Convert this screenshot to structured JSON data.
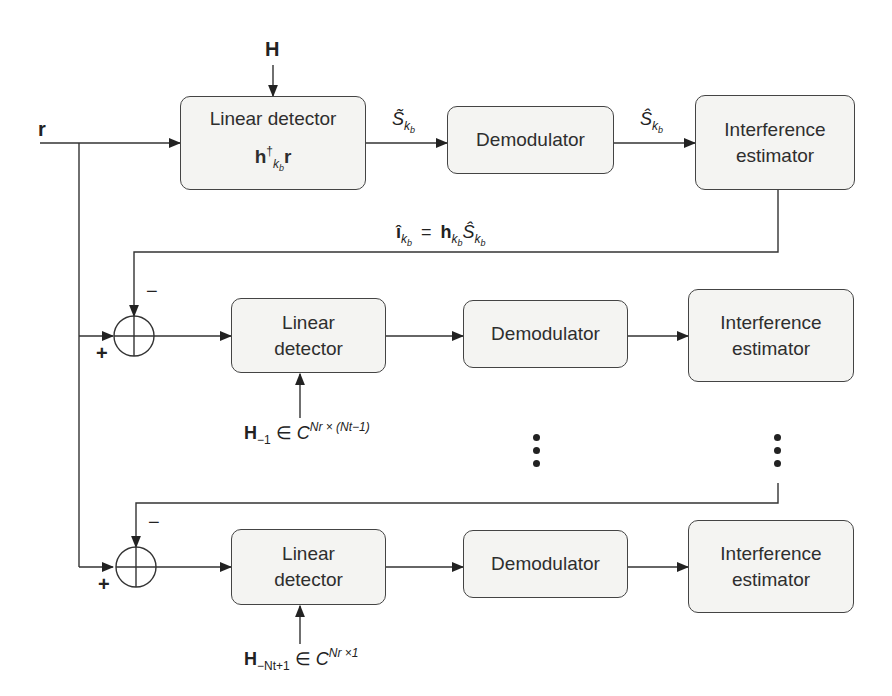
{
  "inputs": {
    "r": "r",
    "H": "H"
  },
  "row1": {
    "linear_detector": {
      "title": "Linear detector",
      "formula_main": "h",
      "formula_sup": "†",
      "formula_sub": "k",
      "formula_subsub": "b",
      "formula_tail": "r"
    },
    "edge1": {
      "symbol": "S̃",
      "sub": "k",
      "subsub": "b"
    },
    "demodulator": {
      "title": "Demodulator"
    },
    "edge2": {
      "symbol": "Ŝ",
      "sub": "k",
      "subsub": "b"
    },
    "interference_estimator": {
      "line1": "Interference",
      "line2": "estimator"
    },
    "feedback": {
      "lhs": "î",
      "lhs_sub": "k",
      "lhs_subsub": "b",
      "eq": "=",
      "rhs_h": "h",
      "rhs_h_sub": "k",
      "rhs_h_subsub": "b",
      "rhs_s": "Ŝ",
      "rhs_s_sub": "k",
      "rhs_s_subsub": "b"
    }
  },
  "row2": {
    "sum_plus": "+",
    "sum_minus": "−",
    "linear_detector": {
      "line1": "Linear",
      "line2": "detector"
    },
    "channel_label": {
      "H": "H",
      "H_sub": "−1",
      "in": "∈",
      "C": "C",
      "exp": "Nr × (Nt−1)"
    },
    "demodulator": {
      "title": "Demodulator"
    },
    "interference_estimator": {
      "line1": "Interference",
      "line2": "estimator"
    }
  },
  "row3": {
    "sum_plus": "+",
    "sum_minus": "−",
    "linear_detector": {
      "line1": "Linear",
      "line2": "detector"
    },
    "channel_label": {
      "H": "H",
      "H_sub": "−Nt+1",
      "in": "∈",
      "C": "C",
      "exp": "Nr ×1"
    },
    "demodulator": {
      "title": "Demodulator"
    },
    "interference_estimator": {
      "line1": "Interference",
      "line2": "estimator"
    }
  },
  "colors": {
    "line": "#333333",
    "box_fill": "#f4f4f2",
    "box_border": "#444444"
  }
}
